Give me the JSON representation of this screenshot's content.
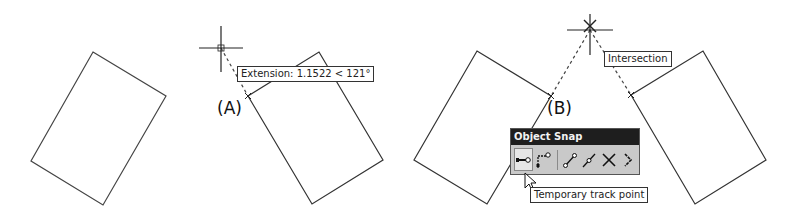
{
  "panel_a": {
    "label": "(A)",
    "tooltip": "Extension: 1.1522 < 121°"
  },
  "panel_b": {
    "label": "(B)",
    "tooltip": "Intersection"
  },
  "toolbar": {
    "title": "Object Snap",
    "buttons": [
      {
        "name": "temporary-track-point-icon",
        "active": true
      },
      {
        "name": "snap-from-icon"
      },
      {
        "name": "snap-endpoint-icon"
      },
      {
        "name": "snap-midpoint-icon"
      },
      {
        "name": "snap-intersection-icon"
      },
      {
        "name": "snap-apparent-intersection-icon"
      }
    ],
    "tooltip": "Temporary track point"
  },
  "colors": {
    "line": "#333333",
    "toolbar_title_bg": "#1e1e1e",
    "toolbar_bg": "#c9c9c9"
  }
}
